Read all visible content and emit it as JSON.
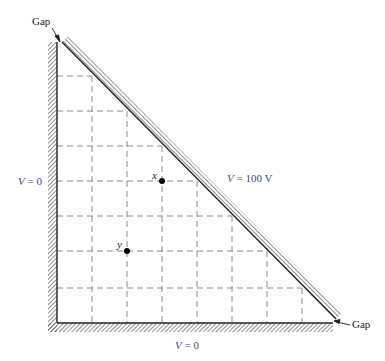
{
  "labels": {
    "gap_top": "Gap",
    "gap_bottom": "Gap",
    "left_boundary": {
      "var": "V",
      "eq": " = 0"
    },
    "bottom_boundary": {
      "var": "V",
      "eq": " = 0"
    },
    "diagonal_boundary": {
      "var": "V",
      "eq": " = 100 V"
    },
    "point_x": "x",
    "point_y": "y"
  },
  "grid": {
    "spacing_px": 35,
    "vertical_lines_x": [
      92,
      127,
      162,
      197,
      232,
      267,
      302
    ],
    "horizontal_lines_y": [
      76,
      111,
      146,
      181,
      216,
      251,
      288
    ]
  },
  "points": [
    {
      "name": "x",
      "cx": 162,
      "cy": 181
    },
    {
      "name": "y",
      "cx": 127,
      "cy": 251
    }
  ],
  "colors": {
    "label_blue": "#3b4b8a",
    "grid": "#8a8a8a",
    "wall": "#333333"
  }
}
